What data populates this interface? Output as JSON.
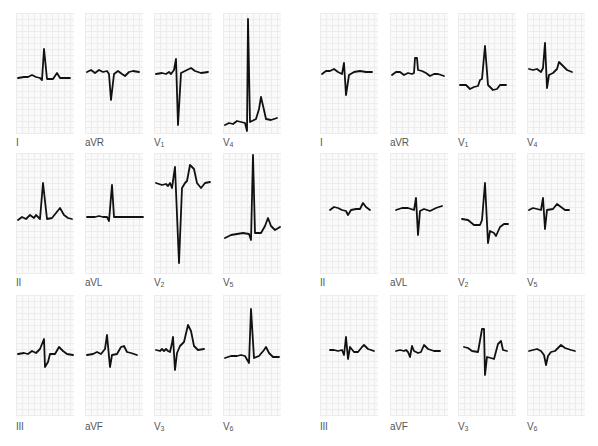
{
  "figure": {
    "panels_left": [
      {
        "lead": "I",
        "row": 0,
        "col": 0
      },
      {
        "lead": "aVR",
        "row": 0,
        "col": 1
      },
      {
        "lead": "V1",
        "row": 0,
        "col": 2
      },
      {
        "lead": "V4",
        "row": 0,
        "col": 3
      },
      {
        "lead": "II",
        "row": 1,
        "col": 0
      },
      {
        "lead": "aVL",
        "row": 1,
        "col": 1
      },
      {
        "lead": "V2",
        "row": 1,
        "col": 2
      },
      {
        "lead": "V5",
        "row": 1,
        "col": 3
      },
      {
        "lead": "III",
        "row": 2,
        "col": 0
      },
      {
        "lead": "aVF",
        "row": 2,
        "col": 1
      },
      {
        "lead": "V3",
        "row": 2,
        "col": 2
      },
      {
        "lead": "V6",
        "row": 2,
        "col": 3
      }
    ],
    "panels_right": [
      {
        "lead": "I",
        "row": 0,
        "col": 0
      },
      {
        "lead": "aVR",
        "row": 0,
        "col": 1
      },
      {
        "lead": "V1",
        "row": 0,
        "col": 2
      },
      {
        "lead": "V4",
        "row": 0,
        "col": 3
      },
      {
        "lead": "II",
        "row": 1,
        "col": 0
      },
      {
        "lead": "aVL",
        "row": 1,
        "col": 1
      },
      {
        "lead": "V2",
        "row": 1,
        "col": 2
      },
      {
        "lead": "V5",
        "row": 1,
        "col": 3
      },
      {
        "lead": "III",
        "row": 2,
        "col": 0
      },
      {
        "lead": "aVF",
        "row": 2,
        "col": 1
      },
      {
        "lead": "V3",
        "row": 2,
        "col": 2
      },
      {
        "lead": "V6",
        "row": 2,
        "col": 3
      }
    ]
  },
  "labels": {
    "L": {
      "I": "I",
      "aVR": "aVR",
      "V1": "V",
      "V1n": "1",
      "V4": "V",
      "V4n": "4",
      "II": "II",
      "aVL": "aVL",
      "V2": "V",
      "V2n": "2",
      "V5": "V",
      "V5n": "5",
      "III": "III",
      "aVF": "aVF",
      "V3": "V",
      "V3n": "3",
      "V6": "V",
      "V6n": "6"
    },
    "R": {
      "I": "I",
      "aVR": "aVR",
      "V1": "V",
      "V1n": "1",
      "V4": "V",
      "V4n": "4",
      "II": "II",
      "aVL": "aVL",
      "V2": "V",
      "V2n": "2",
      "V5": "V",
      "V5n": "5",
      "III": "III",
      "aVF": "aVF",
      "V3": "V",
      "V3n": "3",
      "V6": "V",
      "V6n": "6"
    }
  },
  "colors": {
    "trace": "#111111",
    "grid": "#ececec",
    "label": "#555555"
  }
}
